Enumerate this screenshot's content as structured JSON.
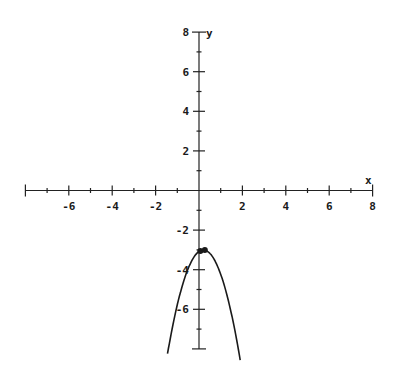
{
  "chart_data": {
    "type": "line",
    "title": "",
    "xlabel": "x",
    "ylabel": "y",
    "xlim": [
      -8,
      8
    ],
    "ylim": [
      -8,
      8
    ],
    "grid": false,
    "x_ticks": [
      -6,
      -4,
      -2,
      2,
      4,
      6,
      8
    ],
    "y_ticks": [
      8,
      6,
      4,
      2,
      -2,
      -4,
      -6
    ],
    "minor_tick_step": 1,
    "major_tick_step": 2,
    "series": [
      {
        "name": "parabola",
        "equation_approx": "y = -2(x - 0.2)^2 - 3",
        "x": [
          -1.45,
          -1.2,
          -1.0,
          -0.8,
          -0.6,
          -0.4,
          -0.2,
          0.0,
          0.2,
          0.4,
          0.6,
          0.8,
          1.0,
          1.2,
          1.4,
          1.6,
          1.9
        ],
        "y": [
          -8.4,
          -7.2,
          -6.4,
          -6.0,
          -5.1,
          -3.7,
          -3.3,
          -3.1,
          -3.0,
          -3.1,
          -3.3,
          -3.5,
          -4.3,
          -5.0,
          -5.9,
          -6.9,
          -8.4
        ]
      }
    ],
    "points": [
      {
        "label": "vertex",
        "x": 0.2,
        "y": -3
      }
    ]
  },
  "axes": {
    "x_label": "x",
    "y_label": "y"
  }
}
